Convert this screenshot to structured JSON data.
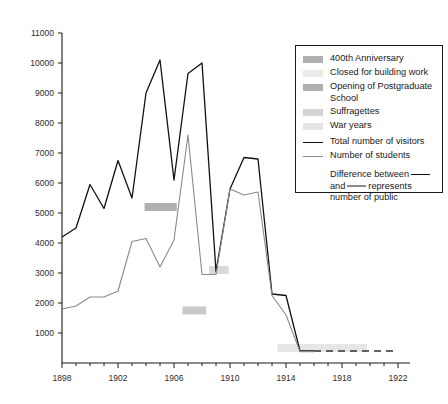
{
  "legend": {
    "swatch_items": [
      {
        "label": "400th Anniversary",
        "color": "#b0b0b0",
        "name": "anniversary"
      },
      {
        "label": "Closed for building work",
        "color": "#eaeaea",
        "name": "closed-building-work"
      },
      {
        "label": "Opening of Postgraduate School",
        "color": "#b0b0b0",
        "name": "postgraduate-school"
      },
      {
        "label": "Suffragettes",
        "color": "#d4d4d4",
        "name": "suffragettes"
      },
      {
        "label": "War years",
        "color": "#e4e4e4",
        "name": "war-years"
      }
    ],
    "line_items": [
      {
        "label": "Total number of visitors",
        "color": "#111111",
        "name": "total-visitors"
      },
      {
        "label": "Number of students",
        "color": "#8a8a8a",
        "name": "number-of-students"
      }
    ],
    "note_part1": "Difference between",
    "note_part2": "and",
    "note_part3": "represents",
    "note_part4": "number of public"
  },
  "axes": {
    "y_ticks": [
      "11000",
      "10000",
      "9000",
      "8000",
      "7000",
      "6000",
      "5000",
      "4000",
      "3000",
      "2000",
      "1000"
    ],
    "x_ticks": [
      "1898",
      "1902",
      "1906",
      "1910",
      "1914",
      "1918",
      "1922"
    ],
    "ylabel": "",
    "xlabel": ""
  },
  "chart_data": {
    "type": "line",
    "title": "",
    "xlabel": "",
    "ylabel": "",
    "xlim": [
      1898,
      1922
    ],
    "ylim": [
      0,
      11000
    ],
    "x_tick_step": 4,
    "x_minor_tick_step": 1,
    "y_tick_step": 1000,
    "grid": false,
    "legend_position": "right",
    "series": [
      {
        "name": "Total number of visitors",
        "color": "#111111",
        "x": [
          1898,
          1899,
          1900,
          1901,
          1902,
          1903,
          1904,
          1905,
          1906,
          1907,
          1908,
          1909,
          1910,
          1911,
          1912,
          1913,
          1914,
          1915,
          1916
        ],
        "values": [
          4200,
          4500,
          5950,
          5150,
          6750,
          5500,
          9000,
          10100,
          6100,
          9650,
          10000,
          3050,
          5800,
          6850,
          6800,
          2300,
          2250,
          400,
          400
        ]
      },
      {
        "name": "Number of students",
        "color": "#8a8a8a",
        "x": [
          1898,
          1899,
          1900,
          1901,
          1902,
          1903,
          1904,
          1905,
          1906,
          1907,
          1908,
          1909,
          1910,
          1911,
          1912,
          1913,
          1914,
          1915,
          1916
        ],
        "values": [
          1800,
          1900,
          2200,
          2200,
          2400,
          4050,
          4150,
          3200,
          4100,
          7600,
          2950,
          2950,
          5800,
          5600,
          5700,
          2250,
          1600,
          380,
          380
        ]
      }
    ],
    "dashed_tail": {
      "name": "extrapolated-baseline",
      "color": "#333333",
      "x_start": 1916,
      "x_end": 1922,
      "value": 400
    },
    "event_markers": [
      {
        "name": "400th Anniversary",
        "x_start": 1903.9,
        "x_end": 1906.2,
        "y": 5200,
        "color": "#b0b0b0"
      },
      {
        "name": "Opening of Postgraduate School",
        "x_start": 1908.5,
        "x_end": 1909.9,
        "y": 3100,
        "color": "#d8d8d8"
      },
      {
        "name": "Suffragettes",
        "x_start": 1906.6,
        "x_end": 1908.3,
        "y": 1750,
        "color": "#c9c9c9"
      },
      {
        "name": "War years",
        "x_start": 1913.4,
        "x_end": 1919.8,
        "y": 500,
        "color": "#e6e6e6"
      }
    ]
  }
}
